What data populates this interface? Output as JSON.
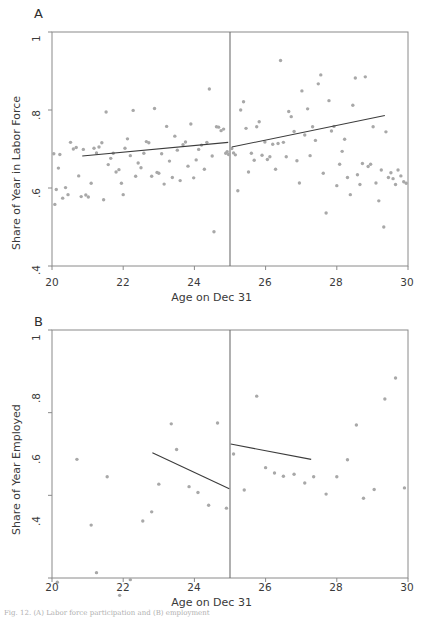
{
  "figure": {
    "caption": "Fig. 12.   (A) Labor force participation and (B) employment"
  },
  "panels": [
    {
      "letter": "A",
      "ylabel": "Share of Year in Labor Force",
      "xlabel": "Age on Dec 31",
      "chart_ref": 0
    },
    {
      "letter": "B",
      "ylabel": "Share of Year Employed",
      "xlabel": "Age on Dec 31",
      "chart_ref": 1
    }
  ],
  "chart_data": [
    {
      "type": "scatter",
      "title": "A",
      "xlabel": "Age on Dec 31",
      "ylabel": "Share of Year in Labor Force",
      "xlim": [
        20,
        30
      ],
      "ylim": [
        0.4,
        1.0
      ],
      "xticks": [
        20,
        22,
        24,
        26,
        28,
        30
      ],
      "xtick_labels": [
        "20",
        "22",
        "24",
        "26",
        "28",
        "30"
      ],
      "yticks": [
        0.4,
        0.6,
        0.8,
        1.0
      ],
      "ytick_labels": [
        ".4",
        ".6",
        ".8",
        "1"
      ],
      "grid": false,
      "legend": "none",
      "marker_color": "#a8a8a8",
      "line_color": "#3c3c3c",
      "cutoff": {
        "x": 25,
        "label": "",
        "color": "#6e6e6e"
      },
      "points": [
        [
          20.05,
          0.688
        ],
        [
          20.08,
          0.558
        ],
        [
          20.12,
          0.596
        ],
        [
          20.18,
          0.651
        ],
        [
          20.22,
          0.686
        ],
        [
          20.3,
          0.574
        ],
        [
          20.38,
          0.601
        ],
        [
          20.45,
          0.583
        ],
        [
          20.52,
          0.717
        ],
        [
          20.6,
          0.7
        ],
        [
          20.68,
          0.704
        ],
        [
          20.75,
          0.631
        ],
        [
          20.82,
          0.578
        ],
        [
          20.88,
          0.699
        ],
        [
          20.95,
          0.582
        ],
        [
          21.02,
          0.577
        ],
        [
          21.1,
          0.612
        ],
        [
          21.18,
          0.702
        ],
        [
          21.25,
          0.69
        ],
        [
          21.32,
          0.705
        ],
        [
          21.4,
          0.716
        ],
        [
          21.45,
          0.57
        ],
        [
          21.52,
          0.795
        ],
        [
          21.58,
          0.66
        ],
        [
          21.65,
          0.676
        ],
        [
          21.72,
          0.689
        ],
        [
          21.8,
          0.641
        ],
        [
          21.88,
          0.647
        ],
        [
          21.95,
          0.612
        ],
        [
          22.0,
          0.583
        ],
        [
          22.05,
          0.702
        ],
        [
          22.12,
          0.726
        ],
        [
          22.2,
          0.683
        ],
        [
          22.28,
          0.799
        ],
        [
          22.35,
          0.63
        ],
        [
          22.42,
          0.664
        ],
        [
          22.5,
          0.652
        ],
        [
          22.58,
          0.689
        ],
        [
          22.65,
          0.719
        ],
        [
          22.72,
          0.716
        ],
        [
          22.8,
          0.63
        ],
        [
          22.88,
          0.804
        ],
        [
          22.95,
          0.64
        ],
        [
          23.0,
          0.638
        ],
        [
          23.08,
          0.688
        ],
        [
          23.15,
          0.61
        ],
        [
          23.22,
          0.758
        ],
        [
          23.3,
          0.669
        ],
        [
          23.38,
          0.627
        ],
        [
          23.45,
          0.733
        ],
        [
          23.52,
          0.697
        ],
        [
          23.6,
          0.619
        ],
        [
          23.68,
          0.711
        ],
        [
          23.75,
          0.718
        ],
        [
          23.82,
          0.656
        ],
        [
          23.9,
          0.764
        ],
        [
          23.98,
          0.626
        ],
        [
          24.05,
          0.672
        ],
        [
          24.12,
          0.699
        ],
        [
          24.2,
          0.71
        ],
        [
          24.28,
          0.648
        ],
        [
          24.35,
          0.717
        ],
        [
          24.42,
          0.854
        ],
        [
          24.5,
          0.682
        ],
        [
          24.55,
          0.488
        ],
        [
          24.62,
          0.757
        ],
        [
          24.68,
          0.756
        ],
        [
          24.75,
          0.747
        ],
        [
          24.82,
          0.751
        ],
        [
          24.88,
          0.689
        ],
        [
          24.92,
          0.693
        ],
        [
          24.96,
          0.686
        ],
        [
          25.05,
          0.701
        ],
        [
          25.1,
          0.69
        ],
        [
          25.15,
          0.685
        ],
        [
          25.22,
          0.593
        ],
        [
          25.3,
          0.8
        ],
        [
          25.38,
          0.821
        ],
        [
          25.45,
          0.753
        ],
        [
          25.52,
          0.641
        ],
        [
          25.6,
          0.689
        ],
        [
          25.68,
          0.671
        ],
        [
          25.75,
          0.757
        ],
        [
          25.82,
          0.77
        ],
        [
          25.9,
          0.684
        ],
        [
          25.98,
          0.718
        ],
        [
          26.05,
          0.673
        ],
        [
          26.12,
          0.68
        ],
        [
          26.2,
          0.712
        ],
        [
          26.28,
          0.648
        ],
        [
          26.35,
          0.714
        ],
        [
          26.42,
          0.927
        ],
        [
          26.5,
          0.717
        ],
        [
          26.58,
          0.68
        ],
        [
          26.65,
          0.796
        ],
        [
          26.72,
          0.783
        ],
        [
          26.8,
          0.745
        ],
        [
          26.88,
          0.67
        ],
        [
          26.95,
          0.613
        ],
        [
          27.02,
          0.849
        ],
        [
          27.1,
          0.736
        ],
        [
          27.18,
          0.803
        ],
        [
          27.25,
          0.683
        ],
        [
          27.32,
          0.757
        ],
        [
          27.4,
          0.722
        ],
        [
          27.48,
          0.867
        ],
        [
          27.55,
          0.89
        ],
        [
          27.62,
          0.638
        ],
        [
          27.7,
          0.536
        ],
        [
          27.78,
          0.824
        ],
        [
          27.85,
          0.746
        ],
        [
          27.92,
          0.758
        ],
        [
          28.0,
          0.606
        ],
        [
          28.08,
          0.661
        ],
        [
          28.15,
          0.694
        ],
        [
          28.22,
          0.725
        ],
        [
          28.3,
          0.627
        ],
        [
          28.38,
          0.583
        ],
        [
          28.45,
          0.812
        ],
        [
          28.52,
          0.882
        ],
        [
          28.58,
          0.634
        ],
        [
          28.65,
          0.609
        ],
        [
          28.72,
          0.663
        ],
        [
          28.8,
          0.885
        ],
        [
          28.88,
          0.655
        ],
        [
          28.95,
          0.661
        ],
        [
          29.02,
          0.757
        ],
        [
          29.1,
          0.613
        ],
        [
          29.18,
          0.567
        ],
        [
          29.25,
          0.646
        ],
        [
          29.32,
          0.5
        ],
        [
          29.38,
          0.744
        ],
        [
          29.45,
          0.627
        ],
        [
          29.52,
          0.639
        ],
        [
          29.58,
          0.624
        ],
        [
          29.65,
          0.609
        ],
        [
          29.72,
          0.646
        ],
        [
          29.8,
          0.631
        ],
        [
          29.88,
          0.616
        ],
        [
          29.95,
          0.612
        ]
      ],
      "fit_lines": [
        {
          "side": "left",
          "x": [
            20.85,
            24.95
          ],
          "y": [
            0.682,
            0.717
          ]
        },
        {
          "side": "right",
          "x": [
            25.05,
            29.35
          ],
          "y": [
            0.705,
            0.786
          ]
        }
      ]
    },
    {
      "type": "scatter",
      "title": "B",
      "xlabel": "Age on Dec 31",
      "ylabel": "Share of Year Employed",
      "xlim": [
        20,
        30
      ],
      "ylim": [
        0.4,
        1.0
      ],
      "xticks": [
        20,
        22,
        24,
        26,
        28,
        30
      ],
      "xtick_labels": [
        "20",
        "22",
        "24",
        "26",
        "28",
        "30"
      ],
      "yticks": [
        0.4,
        0.6,
        0.8,
        1.0
      ],
      "ytick_labels": [
        ".4",
        ".6",
        ".8",
        "1"
      ],
      "grid": false,
      "legend": "none",
      "marker_color": "#a8a8a8",
      "line_color": "#3c3c3c",
      "cutoff": {
        "x": 25,
        "label": "",
        "color": "#6e6e6e"
      },
      "points": [
        [
          20.15,
          0.39
        ],
        [
          20.4,
          0.212
        ],
        [
          20.7,
          0.687
        ],
        [
          21.1,
          0.528
        ],
        [
          21.2,
          0.333
        ],
        [
          21.25,
          0.413
        ],
        [
          21.55,
          0.645
        ],
        [
          21.9,
          0.358
        ],
        [
          22.2,
          0.396
        ],
        [
          22.55,
          0.538
        ],
        [
          22.8,
          0.56
        ],
        [
          23.0,
          0.627
        ],
        [
          23.35,
          0.773
        ],
        [
          23.5,
          0.711
        ],
        [
          23.85,
          0.621
        ],
        [
          24.1,
          0.607
        ],
        [
          24.4,
          0.576
        ],
        [
          24.65,
          0.775
        ],
        [
          24.9,
          0.569
        ],
        [
          25.1,
          0.7
        ],
        [
          25.4,
          0.613
        ],
        [
          25.75,
          0.84
        ],
        [
          26.0,
          0.667
        ],
        [
          26.25,
          0.654
        ],
        [
          26.5,
          0.646
        ],
        [
          26.8,
          0.651
        ],
        [
          27.1,
          0.63
        ],
        [
          27.35,
          0.645
        ],
        [
          27.7,
          0.603
        ],
        [
          28.0,
          0.645
        ],
        [
          28.3,
          0.686
        ],
        [
          28.55,
          0.77
        ],
        [
          28.75,
          0.593
        ],
        [
          29.05,
          0.614
        ],
        [
          29.35,
          0.833
        ],
        [
          29.65,
          0.884
        ],
        [
          29.9,
          0.618
        ]
      ],
      "fit_lines": [
        {
          "side": "left",
          "x": [
            22.82,
            24.98
          ],
          "y": [
            0.703,
            0.616
          ]
        },
        {
          "side": "right",
          "x": [
            25.02,
            27.28
          ],
          "y": [
            0.724,
            0.687
          ]
        }
      ]
    }
  ]
}
